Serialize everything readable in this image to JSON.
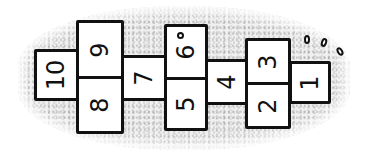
{
  "illustration": {
    "subject": "hopscotch grid on textured ground",
    "colors": {
      "ground": "#e6e6e6",
      "line": "#111111",
      "box_fill": "#ffffff"
    },
    "squares": [
      {
        "label": "10"
      },
      {
        "label": "9"
      },
      {
        "label": "8"
      },
      {
        "label": "7"
      },
      {
        "label": "6"
      },
      {
        "label": "5"
      },
      {
        "label": "4"
      },
      {
        "label": "3"
      },
      {
        "label": "2"
      },
      {
        "label": "1"
      }
    ],
    "pebbles": 4
  }
}
